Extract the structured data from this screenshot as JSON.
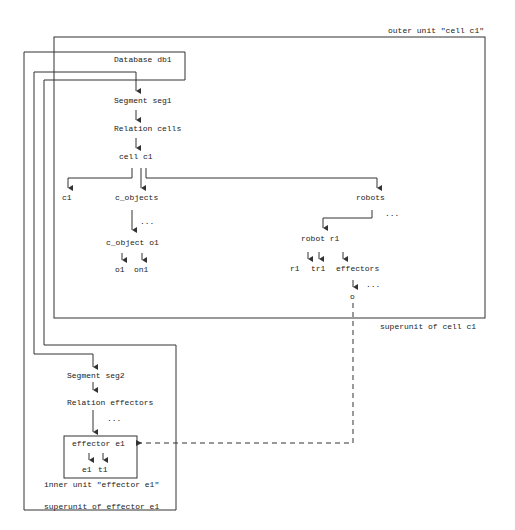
{
  "diagram": {
    "outer_unit_label": "outer unit \"cell c1\"",
    "superunit_cell_label": "superunit of cell c1",
    "superunit_effector_label": "superunit of effector e1",
    "inner_unit_label": "inner unit \"effector e1\"",
    "nodes": {
      "database": "Database db1",
      "segment1": "Segment seg1",
      "relation_cells": "Relation cells",
      "cell": "cell c1",
      "c1": "c1",
      "c_objects": "c_objects",
      "c_objects_more": "...",
      "c_object": "c_object o1",
      "o1": "o1",
      "on1": "on1",
      "robots": "robots",
      "robots_more": "...",
      "robot": "robot r1",
      "r1": "r1",
      "tr1": "tr1",
      "effectors": "effectors",
      "effectors_more": "...",
      "o": "o",
      "segment2": "Segment seg2",
      "relation_effectors": "Relation effectors",
      "relation_effectors_more": "...",
      "effector": "effector e1",
      "e1": "e1",
      "t1": "t1"
    }
  }
}
